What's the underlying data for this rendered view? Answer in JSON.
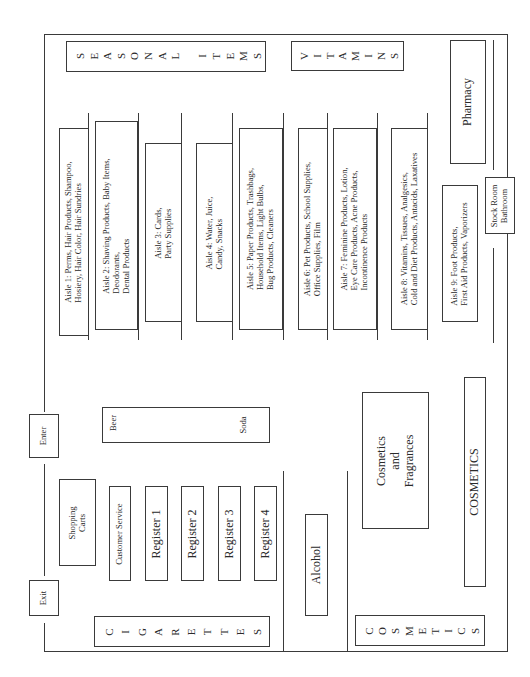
{
  "diagram": {
    "type": "store floor plan",
    "orientation": "rotated 90 degrees counter-clockwise"
  },
  "perimeter": {
    "seasonal": "SEASONAL ITEMS",
    "seasonal_letters": [
      "S",
      "E",
      "A",
      "S",
      "O",
      "N",
      "A",
      "L",
      " ",
      "I",
      "T",
      "E",
      "M",
      "S"
    ],
    "vitamins": "VITAMINS",
    "vitamins_letters": [
      "V",
      "I",
      "T",
      "A",
      "M",
      "I",
      "N",
      "S"
    ],
    "pharmacy": "Pharmacy",
    "stock_room": [
      "Stock Room",
      "Bathroom"
    ],
    "cigarettes": "CIGARETTES",
    "cigarettes_letters": [
      "C",
      "I",
      "G",
      "A",
      "R",
      "E",
      "T",
      "T",
      "E",
      "S"
    ],
    "cosmetics_wall": "COSMETICS",
    "cosmetics_wall_letters": [
      "C",
      "O",
      "S",
      "M",
      "E",
      "T",
      "I",
      "C",
      "S"
    ],
    "cosmetics_counter": "COSMETICS"
  },
  "aisles": [
    {
      "label": "Aisle 1",
      "lines": [
        "Aisle 1:  Perms,   Hair Products,  Shampoo,",
        "Hosiery,        Hair Color,        Hair Sundries"
      ]
    },
    {
      "label": "Aisle 2",
      "lines": [
        "Aisle 2: Shaving Products,    Baby Items,",
        "             Deodorants,",
        "             Dental Products"
      ]
    },
    {
      "label": "Aisle 3",
      "lines": [
        "Aisle 3:  Cards,",
        "              Party Supplies"
      ]
    },
    {
      "label": "Aisle 4",
      "lines": [
        "Aisle 4:  Water,   Juice,",
        "               Candy,   Snacks"
      ]
    },
    {
      "label": "Aisle 5",
      "lines": [
        "Aisle 5: Paper Products,  Trashbags,",
        "Household Items,    Light Bulbs,",
        "Bug Products,    Cleaners"
      ]
    },
    {
      "label": "Aisle 6",
      "lines": [
        "Aisle 6:  Pet Products,   School Supplies,",
        "Office Supplies,  Film"
      ]
    },
    {
      "label": "Aisle 7",
      "lines": [
        "Aisle 7:  Feminine Products,     Lotion,",
        "Eye Care Products,   Acne Products,",
        "Incontinence  Products"
      ]
    },
    {
      "label": "Aisle 8",
      "lines": [
        "Aisle 8:  Vitamins,    Tissues,    Analgesics,",
        "Cold and Diet Products,  Antacids,  Laxatives"
      ]
    },
    {
      "label": "Aisle 9",
      "lines": [
        "Aisle 9:  Foot Products,",
        "First Aid Products,  Vaporizers"
      ]
    }
  ],
  "front": {
    "exit": "Exit",
    "enter": "Enter",
    "shopping_carts": [
      "Shopping",
      "Carts"
    ],
    "customer_service": "Customer Service",
    "registers": [
      "Register 1",
      "Register 2",
      "Register 3",
      "Register 4"
    ],
    "beer": "Beer",
    "soda": "Soda",
    "alcohol": "Alcohol",
    "cosmetics_fragrances": [
      "Cosmetics",
      "and",
      "Fragrances"
    ]
  }
}
